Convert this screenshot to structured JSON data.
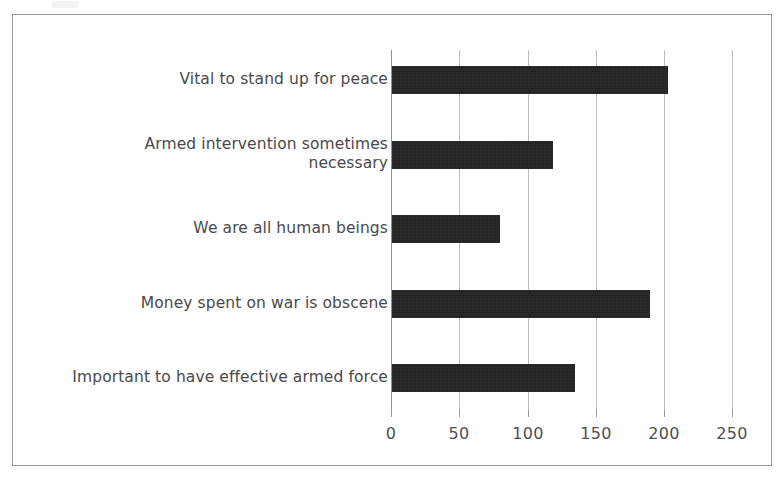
{
  "chart_data": {
    "type": "bar",
    "orientation": "horizontal",
    "title": "",
    "xlabel": "",
    "ylabel": "",
    "xlim": [
      0,
      250
    ],
    "grid": true,
    "legend": "none",
    "bar_color": "#1b1b1b",
    "axis_color": "#9a9a9a",
    "text_color": "#4a4a4a",
    "categories": [
      "Vital to stand up for peace",
      "Armed intervention sometimes necessary",
      "We are all human beings",
      "Money spent on war is obscene",
      "Important to have effective armed force"
    ],
    "values": [
      202,
      118,
      79,
      189,
      134
    ],
    "xticks": [
      "0",
      "50",
      "100",
      "150",
      "200",
      "250"
    ],
    "xtick_values": [
      0,
      50,
      100,
      150,
      200,
      250
    ]
  },
  "labels": {
    "cat0_line1": "Vital to stand up for peace",
    "cat1_line1": "Armed intervention sometimes",
    "cat1_line2": "necessary",
    "cat2_line1": "We are all human beings",
    "cat3_line1": "Money spent on war is obscene",
    "cat4_line1": "Important to have effective armed force"
  }
}
